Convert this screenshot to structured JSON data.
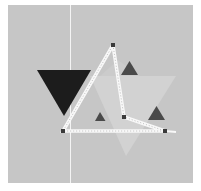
{
  "canvas": {
    "width": 201,
    "height": 191,
    "page_background": "#ffffff",
    "board": {
      "x": 8,
      "y": 5,
      "width": 185,
      "height": 178,
      "color": "#c6c6c6"
    },
    "guide_line": {
      "x": 70,
      "y1": 5,
      "y2": 183,
      "color": "#f4f4f4"
    }
  },
  "shapes": {
    "light_region": {
      "points": "90,76 176,76 126,156",
      "color": "#d2d2d2"
    },
    "light_region_2": {
      "points": "100,76 118,60 140,76",
      "color": "#cbcbcb"
    },
    "large_dark_triangle": {
      "points": "37,70 91,70 64,116",
      "color": "#1c1c1c"
    },
    "small_triangles": [
      {
        "name": "small-triangle-top",
        "points": "121,75 138,75 129.5,61",
        "color": "#4a4a4a"
      },
      {
        "name": "small-triangle-middle",
        "points": "95,121 105.5,121 100,112",
        "color": "#4a4a4a"
      },
      {
        "name": "small-triangle-right",
        "points": "148,120 165,120 156.5,106",
        "color": "#4a4a4a"
      }
    ]
  },
  "polygon": {
    "points": "113,45 124,117 165,131 63,131 113,45",
    "tail": {
      "x1": 165,
      "y1": 131,
      "x2": 176,
      "y2": 132
    },
    "stroke": "#f8f8f8",
    "dash_color": "#c0c0c0",
    "handles": [
      {
        "name": "vertex-handle-top",
        "x": 113,
        "y": 45
      },
      {
        "name": "vertex-handle-inner",
        "x": 124,
        "y": 117
      },
      {
        "name": "vertex-handle-right",
        "x": 165,
        "y": 131
      },
      {
        "name": "vertex-handle-left",
        "x": 63,
        "y": 131
      }
    ],
    "handle_color": "#3a3a3a",
    "handle_size": 4
  }
}
